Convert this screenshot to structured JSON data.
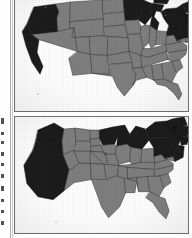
{
  "figure": {
    "name": "two-panel-us-map-figure",
    "kind": "scanned-document-figure",
    "panel_count": 2,
    "background_color": "#ffffff",
    "border_color": "#6d6d6d"
  },
  "legend": {
    "shaded_label": "shaded (highlighted states)",
    "unshaded_label": "unshaded states",
    "shaded_color": "#1c1c1c",
    "unshaded_color": "#7f7f7f",
    "outline_color": "#3d3d3d"
  },
  "panels": [
    {
      "id": "panel-top",
      "name": "conventional-us-map",
      "map_type": "choropleth-geographic",
      "caption": "",
      "shaded_states": [
        "Washington",
        "Oregon",
        "California",
        "Minnesota",
        "Wisconsin",
        "Michigan",
        "New York",
        "Pennsylvania",
        "New Jersey",
        "Connecticut",
        "Rhode Island",
        "Massachusetts",
        "Vermont",
        "New Hampshire",
        "Maine"
      ],
      "unshaded_states": [
        "Idaho",
        "Montana",
        "Nevada",
        "Utah",
        "Arizona",
        "Wyoming",
        "Colorado",
        "New Mexico",
        "North Dakota",
        "South Dakota",
        "Nebraska",
        "Kansas",
        "Oklahoma",
        "Texas",
        "Iowa",
        "Missouri",
        "Arkansas",
        "Louisiana",
        "Illinois",
        "Indiana",
        "Ohio",
        "Kentucky",
        "Tennessee",
        "Mississippi",
        "Alabama",
        "Georgia",
        "Florida",
        "South Carolina",
        "North Carolina",
        "Virginia",
        "West Virginia",
        "Maryland",
        "Delaware"
      ]
    },
    {
      "id": "panel-bottom",
      "name": "population-cartogram",
      "map_type": "cartogram-population-weighted",
      "caption": "",
      "shaded_states": [
        "Washington",
        "Oregon",
        "California",
        "Minnesota",
        "Wisconsin",
        "Michigan",
        "New York",
        "Pennsylvania",
        "New Jersey",
        "Connecticut",
        "Rhode Island",
        "Massachusetts",
        "Vermont",
        "New Hampshire",
        "Maine"
      ],
      "unshaded_states": [
        "Idaho",
        "Montana",
        "Nevada",
        "Utah",
        "Arizona",
        "Wyoming",
        "Colorado",
        "New Mexico",
        "North Dakota",
        "South Dakota",
        "Nebraska",
        "Kansas",
        "Oklahoma",
        "Texas",
        "Iowa",
        "Missouri",
        "Arkansas",
        "Louisiana",
        "Illinois",
        "Indiana",
        "Ohio",
        "Kentucky",
        "Tennessee",
        "Mississippi",
        "Alabama",
        "Georgia",
        "Florida",
        "South Carolina",
        "North Carolina",
        "Virginia",
        "West Virginia",
        "Maryland",
        "Delaware"
      ]
    }
  ],
  "margin_artifacts": {
    "name": "page-edge-text-fragments",
    "description": "illegible cropped marks at the left page edge",
    "marks": [
      {
        "top": 118,
        "height": 6
      },
      {
        "top": 132,
        "height": 3
      },
      {
        "top": 141,
        "height": 3
      },
      {
        "top": 152,
        "height": 4
      },
      {
        "top": 163,
        "height": 3
      },
      {
        "top": 174,
        "height": 4
      },
      {
        "top": 186,
        "height": 5
      },
      {
        "top": 199,
        "height": 3
      },
      {
        "top": 210,
        "height": 3
      },
      {
        "top": 221,
        "height": 4
      }
    ]
  }
}
